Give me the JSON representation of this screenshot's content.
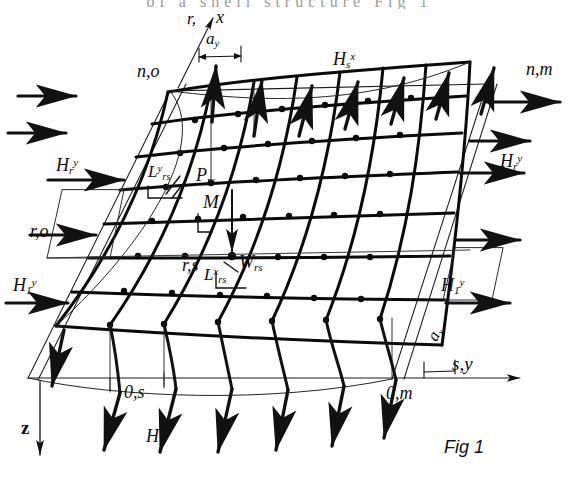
{
  "figure": {
    "caption": "Fig 1",
    "top_cut_text": "of a shell structure Fig 1"
  },
  "axes": {
    "x_label": "x",
    "y_label": "s,y",
    "z_label": "z",
    "x_origin_row": "r,",
    "spacing_y": "a",
    "spacing_y_sub": "y",
    "spacing_x": "a",
    "spacing_x_sub": "x"
  },
  "corners": {
    "top_left": "n,o",
    "top_right": "n,m",
    "bottom_left": "0,s",
    "bottom_right": "0,m",
    "left_mid": "r,o",
    "center_node": "r,s"
  },
  "edge_forces": {
    "top": {
      "base": "H",
      "sub": "s",
      "sup": "x"
    },
    "bottom": {
      "base": "H",
      "sub": "s",
      "sup": "x"
    },
    "left_upper": {
      "base": "H",
      "sub": "r",
      "sup": "y"
    },
    "left_lower": {
      "base": "H",
      "sub": "1",
      "sup": "y"
    },
    "right_upper": {
      "base": "H",
      "sub": "r",
      "sup": "y"
    },
    "right_lower": {
      "base": "H",
      "sub": "1",
      "sup": "y"
    }
  },
  "node_quantities": {
    "load": {
      "base": "P",
      "sub": "rs"
    },
    "moment": {
      "base": "M",
      "sub": ""
    },
    "deflection": {
      "base": "W",
      "sub": "rs"
    },
    "length_y": {
      "base": "L",
      "sub": "rs",
      "sup": "y"
    },
    "length_x": {
      "base": "L",
      "sub": "rs",
      "sup": "x"
    }
  },
  "colors": {
    "ink": "#0d0d0d",
    "thin": "#2b2b2b",
    "paper": "#ffffff"
  },
  "grid": {
    "rows": 7,
    "cols": 8,
    "type": "hyperbolic-paraboloid-saddle-net"
  }
}
